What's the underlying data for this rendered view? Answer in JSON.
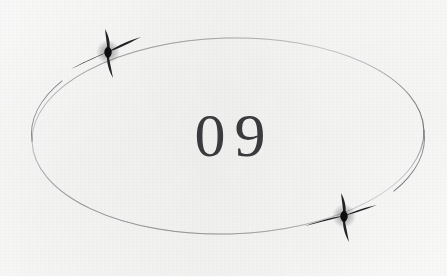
{
  "document": {
    "kind": "scanned-page-ornament",
    "page_number_label": "09",
    "background_color": "#f8f8f7",
    "ink_color": "#3b3b3e"
  },
  "ornament": {
    "ellipse": {
      "icon": "ellipse-outline-icon",
      "center_x": 228,
      "center_y": 136,
      "radius_x": 196,
      "radius_y": 98,
      "stroke_color": "#6f6f72",
      "stroke_width_px": 1,
      "rotation_deg": -1.5
    },
    "stars": [
      {
        "icon": "four-pointed-star-icon",
        "name": "star-top-left",
        "center_x": 108,
        "center_y": 52,
        "size_px": 34,
        "color": "#18181a"
      },
      {
        "icon": "four-pointed-star-icon",
        "name": "star-bottom-right",
        "center_x": 344,
        "center_y": 216,
        "size_px": 34,
        "color": "#18181a"
      }
    ]
  },
  "page_number": {
    "text": "09",
    "font_style": "serif",
    "color": "#3b3b3e",
    "center_x": 230,
    "center_y": 137
  }
}
